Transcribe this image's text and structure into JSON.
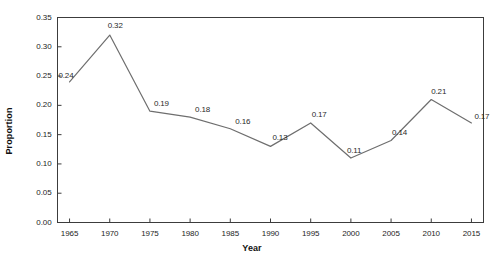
{
  "chart_data": {
    "type": "line",
    "title": "",
    "xlabel": "Year",
    "ylabel": "Proportion",
    "categories": [
      1965,
      1970,
      1975,
      1980,
      1985,
      1990,
      1995,
      2000,
      2005,
      2010,
      2015
    ],
    "x_tick_labels": [
      "1965",
      "1970",
      "1975",
      "1980",
      "1985",
      "1990",
      "1995",
      "2000",
      "2005",
      "2010",
      "2015"
    ],
    "values": [
      0.24,
      0.32,
      0.19,
      0.18,
      0.16,
      0.13,
      0.17,
      0.11,
      0.14,
      0.21,
      0.17
    ],
    "point_labels": [
      "0.24",
      "0.32",
      "0.19",
      "0.18",
      "0.16",
      "0.13",
      "0.17",
      "0.11",
      "0.14",
      "0.21",
      "0.17"
    ],
    "xlim": [
      1963.5,
      2016.5
    ],
    "ylim": [
      0.0,
      0.35
    ],
    "y_ticks": [
      0.0,
      0.05,
      0.1,
      0.15,
      0.2,
      0.25,
      0.3,
      0.35
    ],
    "y_tick_labels": [
      "0.00",
      "0.05",
      "0.10",
      "0.15",
      "0.20",
      "0.25",
      "0.30",
      "0.35"
    ],
    "grid": false,
    "legend": null,
    "line_color": "#6e6e6e",
    "axis_color": "#3c3c3c",
    "background": "#ffffff"
  }
}
